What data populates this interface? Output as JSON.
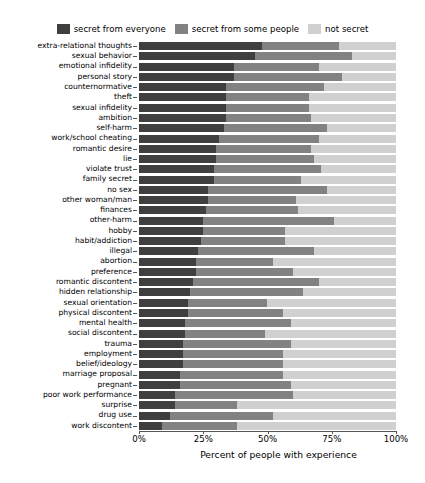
{
  "chart_data": {
    "type": "bar",
    "orientation": "horizontal",
    "stacked": true,
    "title": "",
    "xlabel": "Percent of people with experience",
    "ylabel": "",
    "xlim": [
      0,
      100
    ],
    "xticks": [
      0,
      25,
      50,
      75,
      100
    ],
    "xticklabels": [
      "0%",
      "25%",
      "50%",
      "75%",
      "100%"
    ],
    "grid": false,
    "legend_position": "top-center",
    "colors": {
      "secret_from_everyone": "#3f3f3f",
      "secret_from_some_people": "#828282",
      "not_secret": "#d0d0d0",
      "axis": "#555555",
      "background": "#ffffff"
    },
    "legend": [
      "secret from everyone",
      "secret from some people",
      "not secret"
    ],
    "categories": [
      "extra-relational thoughts",
      "sexual behavior",
      "emotional infidelity",
      "personal story",
      "counternormative",
      "theft",
      "sexual infidelity",
      "ambition",
      "self-harm",
      "work/school cheating",
      "romantic desire",
      "lie",
      "violate trust",
      "family secret",
      "no sex",
      "other woman/man",
      "finances",
      "other-harm",
      "hobby",
      "habit/addiction",
      "illegal",
      "abortion",
      "preference",
      "romantic discontent",
      "hidden relationship",
      "sexual orientation",
      "physical discontent",
      "mental health",
      "social discontent",
      "trauma",
      "employment",
      "belief/ideology",
      "marriage proposal",
      "pregnant",
      "poor work performance",
      "surprise",
      "drug use",
      "work discontent"
    ],
    "series": [
      {
        "name": "secret from everyone",
        "values": [
          48,
          45,
          37,
          37,
          34,
          34,
          34,
          34,
          33,
          31,
          30,
          30,
          29,
          29,
          27,
          27,
          26,
          25,
          25,
          24,
          23,
          22,
          22,
          21,
          20,
          19,
          19,
          18,
          18,
          17,
          17,
          17,
          16,
          16,
          14,
          14,
          12,
          9
        ]
      },
      {
        "name": "secret from some people",
        "values": [
          30,
          38,
          33,
          42,
          38,
          32,
          32,
          33,
          40,
          39,
          37,
          38,
          42,
          34,
          46,
          34,
          36,
          51,
          32,
          33,
          45,
          30,
          38,
          49,
          44,
          31,
          37,
          41,
          31,
          42,
          39,
          39,
          40,
          43,
          46,
          24,
          40,
          29
        ]
      },
      {
        "name": "not secret",
        "values": [
          22,
          17,
          30,
          21,
          28,
          34,
          34,
          33,
          27,
          30,
          33,
          32,
          29,
          37,
          27,
          39,
          38,
          24,
          43,
          43,
          32,
          48,
          40,
          30,
          36,
          50,
          44,
          41,
          51,
          41,
          44,
          44,
          44,
          41,
          40,
          62,
          48,
          62
        ]
      }
    ]
  }
}
